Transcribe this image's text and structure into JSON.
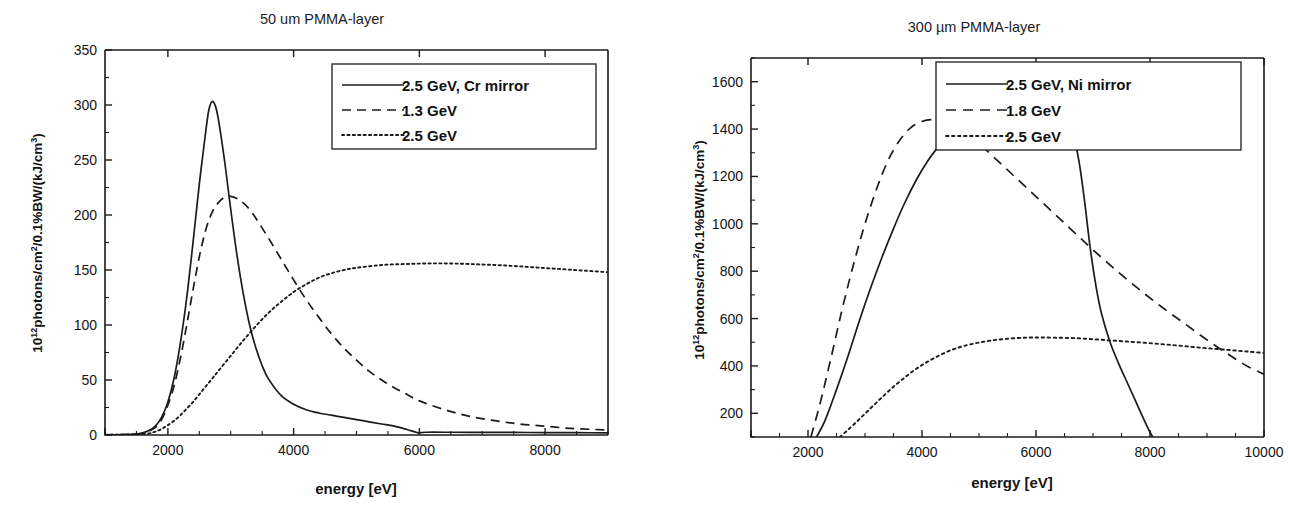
{
  "figure": {
    "background_color": "#ffffff",
    "ink_color": "#1b1b1b"
  },
  "chart_data": [
    {
      "id": "left",
      "type": "line",
      "title": "50 um PMMA-layer",
      "xlabel": "energy [eV]",
      "ylabel": "10¹²photons/cm²/0.1%BW/(kJ/cm³)",
      "ylabel_parts": {
        "base": "10",
        "exponent": "12",
        "mid": "photons/cm",
        "exp2": "2",
        "tail": "/0.1%BW/(kJ/cm",
        "exp3": "3",
        "close": ")"
      },
      "xlim": [
        1000,
        9000
      ],
      "ylim": [
        0,
        350
      ],
      "xticks": [
        2000,
        4000,
        6000,
        8000
      ],
      "xtick_labels": [
        "2000",
        "4000",
        "6000",
        "8000"
      ],
      "x_minor_step": 500,
      "yticks": [
        0,
        50,
        100,
        150,
        200,
        250,
        300,
        350
      ],
      "ytick_labels": [
        "0",
        "50",
        "100",
        "150",
        "200",
        "250",
        "300",
        "350"
      ],
      "y_minor_step": 25,
      "grid": false,
      "legend_position": "upper-right",
      "series": [
        {
          "name": "2.5 GeV, Cr mirror",
          "style": "solid",
          "dash": "none",
          "points": [
            [
              1000,
              0.2
            ],
            [
              1300,
              0.4
            ],
            [
              1500,
              1.0
            ],
            [
              1600,
              2.0
            ],
            [
              1700,
              4.0
            ],
            [
              1800,
              8.0
            ],
            [
              1900,
              16.0
            ],
            [
              2000,
              30.0
            ],
            [
              2100,
              52.0
            ],
            [
              2200,
              84.0
            ],
            [
              2300,
              125.0
            ],
            [
              2400,
              175.0
            ],
            [
              2500,
              228.0
            ],
            [
              2600,
              275.0
            ],
            [
              2650,
              295.0
            ],
            [
              2700,
              303.0
            ],
            [
              2750,
              300.0
            ],
            [
              2800,
              288.0
            ],
            [
              2900,
              250.0
            ],
            [
              3000,
              205.0
            ],
            [
              3100,
              163.0
            ],
            [
              3200,
              128.0
            ],
            [
              3300,
              100.0
            ],
            [
              3400,
              79.0
            ],
            [
              3500,
              63.0
            ],
            [
              3600,
              51.0
            ],
            [
              3800,
              36.0
            ],
            [
              4000,
              28.0
            ],
            [
              4200,
              23.0
            ],
            [
              4400,
              20.0
            ],
            [
              4600,
              18.0
            ],
            [
              4800,
              16.0
            ],
            [
              5000,
              14.0
            ],
            [
              5200,
              12.0
            ],
            [
              5400,
              10.0
            ],
            [
              5600,
              8.0
            ],
            [
              5800,
              5.0
            ],
            [
              5950,
              2.5
            ],
            [
              6000,
              2.0
            ],
            [
              6100,
              2.5
            ],
            [
              6500,
              2.5
            ],
            [
              7000,
              2.4
            ],
            [
              7500,
              2.3
            ],
            [
              8000,
              2.2
            ],
            [
              8500,
              2.1
            ],
            [
              9000,
              2.0
            ]
          ]
        },
        {
          "name": "1.3 GeV",
          "style": "dashed",
          "dash": "9,6",
          "points": [
            [
              1000,
              0.2
            ],
            [
              1400,
              0.5
            ],
            [
              1600,
              1.5
            ],
            [
              1700,
              3.5
            ],
            [
              1800,
              7.0
            ],
            [
              1900,
              14.0
            ],
            [
              2000,
              27.0
            ],
            [
              2100,
              45.0
            ],
            [
              2200,
              70.0
            ],
            [
              2300,
              100.0
            ],
            [
              2400,
              132.0
            ],
            [
              2500,
              162.0
            ],
            [
              2600,
              186.0
            ],
            [
              2700,
              202.0
            ],
            [
              2800,
              211.0
            ],
            [
              2900,
              216.0
            ],
            [
              3000,
              217.0
            ],
            [
              3100,
              215.0
            ],
            [
              3200,
              211.0
            ],
            [
              3300,
              205.0
            ],
            [
              3400,
              197.0
            ],
            [
              3600,
              179.0
            ],
            [
              3800,
              160.0
            ],
            [
              4000,
              141.0
            ],
            [
              4200,
              123.0
            ],
            [
              4400,
              107.0
            ],
            [
              4600,
              92.0
            ],
            [
              4800,
              79.0
            ],
            [
              5000,
              68.0
            ],
            [
              5200,
              58.0
            ],
            [
              5400,
              50.0
            ],
            [
              5600,
              43.0
            ],
            [
              5800,
              37.0
            ],
            [
              6000,
              31.0
            ],
            [
              6400,
              23.0
            ],
            [
              6800,
              17.0
            ],
            [
              7200,
              13.0
            ],
            [
              7600,
              10.0
            ],
            [
              8000,
              8.0
            ],
            [
              8400,
              6.0
            ],
            [
              8800,
              5.0
            ],
            [
              9000,
              4.5
            ]
          ]
        },
        {
          "name": "2.5 GeV",
          "style": "dotted",
          "dash": "2.2,3.2",
          "points": [
            [
              1000,
              0.2
            ],
            [
              1500,
              0.5
            ],
            [
              1700,
              1.5
            ],
            [
              1800,
              3.0
            ],
            [
              1900,
              5.5
            ],
            [
              2000,
              9.0
            ],
            [
              2100,
              13.0
            ],
            [
              2200,
              18.0
            ],
            [
              2300,
              24.0
            ],
            [
              2400,
              30.0
            ],
            [
              2500,
              37.0
            ],
            [
              2600,
              44.0
            ],
            [
              2700,
              51.0
            ],
            [
              2800,
              58.0
            ],
            [
              3000,
              72.0
            ],
            [
              3200,
              86.0
            ],
            [
              3400,
              99.0
            ],
            [
              3600,
              111.0
            ],
            [
              3800,
              121.0
            ],
            [
              4000,
              130.0
            ],
            [
              4200,
              137.0
            ],
            [
              4400,
              143.0
            ],
            [
              4600,
              147.0
            ],
            [
              4800,
              150.0
            ],
            [
              5000,
              152.0
            ],
            [
              5400,
              154.5
            ],
            [
              5800,
              155.5
            ],
            [
              6200,
              156.0
            ],
            [
              6600,
              155.8
            ],
            [
              7000,
              155.0
            ],
            [
              7400,
              154.0
            ],
            [
              7800,
              152.5
            ],
            [
              8200,
              151.0
            ],
            [
              8600,
              149.5
            ],
            [
              9000,
              148.0
            ]
          ]
        }
      ]
    },
    {
      "id": "right",
      "type": "line",
      "title": "300 µm PMMA-layer",
      "xlabel": "energy [eV]",
      "ylabel": "10¹²photons/cm²/0.1%BW/(kJ/cm³)",
      "ylabel_parts": {
        "base": "10",
        "exponent": "12",
        "mid": "photons/cm",
        "exp2": "2",
        "tail": "/0.1%BW/(kJ/cm",
        "exp3": "3",
        "close": ")"
      },
      "xlim": [
        1000,
        10000
      ],
      "ylim": [
        100,
        1700
      ],
      "xticks": [
        2000,
        4000,
        6000,
        8000,
        10000
      ],
      "xtick_labels": [
        "2000",
        "4000",
        "6000",
        "8000",
        "10000"
      ],
      "x_minor_step": 500,
      "yticks": [
        200,
        400,
        600,
        800,
        1000,
        1200,
        1400,
        1600
      ],
      "ytick_labels": [
        "200",
        "400",
        "600",
        "800",
        "1000",
        "1200",
        "1400",
        "1600"
      ],
      "y_minor_step": 100,
      "grid": false,
      "legend_position": "upper-right",
      "series": [
        {
          "name": "2.5 GeV, Ni mirror",
          "style": "solid",
          "dash": "none",
          "points": [
            [
              2150,
              100
            ],
            [
              2300,
              170
            ],
            [
              2500,
              300
            ],
            [
              2700,
              440
            ],
            [
              2900,
              590
            ],
            [
              3100,
              730
            ],
            [
              3300,
              860
            ],
            [
              3500,
              980
            ],
            [
              3700,
              1090
            ],
            [
              3900,
              1185
            ],
            [
              4100,
              1265
            ],
            [
              4300,
              1330
            ],
            [
              4500,
              1390
            ],
            [
              4700,
              1430
            ],
            [
              4900,
              1460
            ],
            [
              5100,
              1480
            ],
            [
              5300,
              1495
            ],
            [
              5500,
              1500
            ],
            [
              5700,
              1498
            ],
            [
              5900,
              1490
            ],
            [
              6100,
              1475
            ],
            [
              6300,
              1450
            ],
            [
              6500,
              1410
            ],
            [
              6650,
              1370
            ],
            [
              6750,
              1270
            ],
            [
              6850,
              1100
            ],
            [
              6950,
              900
            ],
            [
              7050,
              740
            ],
            [
              7150,
              620
            ],
            [
              7300,
              500
            ],
            [
              7450,
              410
            ],
            [
              7600,
              330
            ],
            [
              7750,
              250
            ],
            [
              7900,
              170
            ],
            [
              8000,
              120
            ],
            [
              8050,
              100
            ]
          ]
        },
        {
          "name": "1.8 GeV",
          "style": "dashed",
          "dash": "10,7",
          "points": [
            [
              2050,
              100
            ],
            [
              2200,
              230
            ],
            [
              2400,
              430
            ],
            [
              2600,
              640
            ],
            [
              2800,
              830
            ],
            [
              3000,
              1000
            ],
            [
              3200,
              1145
            ],
            [
              3400,
              1265
            ],
            [
              3600,
              1350
            ],
            [
              3800,
              1405
            ],
            [
              4000,
              1432
            ],
            [
              4200,
              1440
            ],
            [
              4400,
              1432
            ],
            [
              4600,
              1412
            ],
            [
              4800,
              1380
            ],
            [
              5000,
              1340
            ],
            [
              5200,
              1295
            ],
            [
              5400,
              1250
            ],
            [
              5600,
              1205
            ],
            [
              5800,
              1160
            ],
            [
              6000,
              1115
            ],
            [
              6200,
              1070
            ],
            [
              6400,
              1025
            ],
            [
              6600,
              980
            ],
            [
              6800,
              935
            ],
            [
              7000,
              890
            ],
            [
              7400,
              805
            ],
            [
              7800,
              725
            ],
            [
              8200,
              650
            ],
            [
              8600,
              580
            ],
            [
              9000,
              510
            ],
            [
              9400,
              445
            ],
            [
              9700,
              400
            ],
            [
              10000,
              365
            ]
          ]
        },
        {
          "name": "2.5 GeV",
          "style": "dotted",
          "dash": "2.5,3.5",
          "points": [
            [
              2560,
              100
            ],
            [
              2700,
              130
            ],
            [
              2900,
              175
            ],
            [
              3100,
              222
            ],
            [
              3300,
              268
            ],
            [
              3500,
              312
            ],
            [
              3700,
              352
            ],
            [
              3900,
              388
            ],
            [
              4100,
              418
            ],
            [
              4300,
              444
            ],
            [
              4500,
              466
            ],
            [
              4700,
              482
            ],
            [
              4900,
              494
            ],
            [
              5100,
              503
            ],
            [
              5300,
              510
            ],
            [
              5500,
              515
            ],
            [
              5700,
              518
            ],
            [
              5900,
              520
            ],
            [
              6100,
              520
            ],
            [
              6400,
              519
            ],
            [
              6700,
              517
            ],
            [
              7000,
              513
            ],
            [
              7300,
              508
            ],
            [
              7600,
              503
            ],
            [
              7900,
              498
            ],
            [
              8200,
              492
            ],
            [
              8500,
              486
            ],
            [
              8800,
              479
            ],
            [
              9100,
              473
            ],
            [
              9400,
              467
            ],
            [
              9700,
              461
            ],
            [
              10000,
              455
            ]
          ]
        }
      ]
    }
  ]
}
